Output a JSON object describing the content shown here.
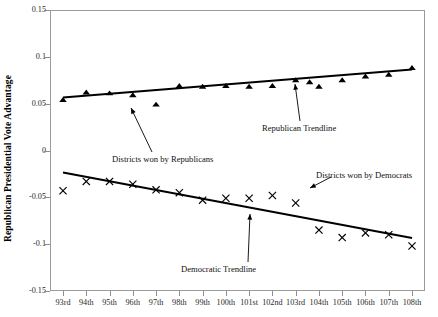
{
  "chart_data": {
    "type": "scatter",
    "title": "",
    "xlabel": "",
    "ylabel": "Republican Presidential Vote Advantage",
    "categories": [
      "93rd",
      "94th",
      "95th",
      "96th",
      "97th",
      "98th",
      "99th",
      "100th",
      "101st",
      "102nd",
      "103rd",
      "104th",
      "105th",
      "106th",
      "107th",
      "108th"
    ],
    "ylim": [
      -0.15,
      0.15
    ],
    "ytick_labels": [
      "0.15",
      "0.1",
      "0.05",
      "0",
      "-0.05",
      "-0.1",
      "-0.15"
    ],
    "ytick_values": [
      0.15,
      0.1,
      0.05,
      0,
      -0.05,
      -0.1,
      -0.15
    ],
    "grid": false,
    "legend": "none",
    "series": [
      {
        "name": "Districts won by Republicans",
        "marker": "triangle",
        "color": "#000000",
        "values": [
          0.054,
          0.062,
          0.061,
          0.059,
          0.049,
          0.069,
          0.068,
          0.069,
          0.068,
          0.069,
          0.075,
          0.068,
          0.075,
          0.079,
          0.081,
          0.088
        ],
        "extra_points": [
          {
            "x_index": 10.6,
            "value": 0.073
          }
        ]
      },
      {
        "name": "Districts won by Democrats",
        "marker": "x",
        "color": "#000000",
        "values": [
          -0.043,
          -0.033,
          -0.033,
          -0.036,
          -0.042,
          -0.045,
          -0.053,
          -0.051,
          -0.051,
          -0.048,
          -0.056,
          -0.085,
          -0.093,
          -0.088,
          -0.09,
          -0.102
        ]
      }
    ],
    "trendlines": [
      {
        "name": "Republican Trendline",
        "x_start_index": 0,
        "y_start": 0.0565,
        "x_end_index": 15,
        "y_end": 0.0865
      },
      {
        "name": "Democratic Trendline",
        "x_start_index": 0,
        "y_start": -0.0235,
        "x_end_index": 15,
        "y_end": -0.0935
      }
    ],
    "annotations": [
      {
        "label": "Districts won by Republicans",
        "points_to_index": 4
      },
      {
        "label": "Republican Trendline",
        "points_to_index": 10
      },
      {
        "label": "Districts won by Democrats",
        "points_to_index": 9
      },
      {
        "label": "Democratic Trendline",
        "points_to_index": 8
      }
    ]
  },
  "annotation_labels": {
    "republicans_points": "Districts won by Republicans",
    "republican_trendline": "Republican Trendline",
    "democrats_points": "Districts won by Democrats",
    "democratic_trendline": "Democratic Trendline"
  }
}
